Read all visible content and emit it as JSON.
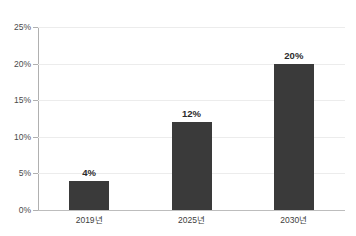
{
  "chart_data": {
    "type": "bar",
    "title": "",
    "title_note": "cropped off at top edge of screenshot",
    "categories": [
      "2019년",
      "2025년",
      "2030년"
    ],
    "values": [
      4,
      12,
      20
    ],
    "value_labels": [
      "4%",
      "12%",
      "20%"
    ],
    "xlabel": "",
    "ylabel": "",
    "ylim": [
      0,
      25
    ],
    "ytick_values": [
      0,
      5,
      10,
      15,
      20,
      25
    ],
    "ytick_labels": [
      "0%",
      "5%",
      "10%",
      "15%",
      "20%",
      "25%"
    ],
    "grid": true,
    "legend": false,
    "bar_color": "#3a3a3a",
    "gridline_color": "#ececec",
    "axis_color": "#b0b0b0"
  }
}
